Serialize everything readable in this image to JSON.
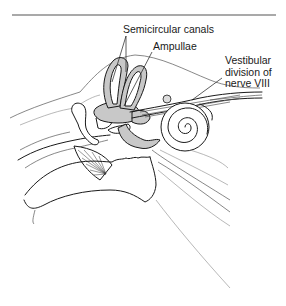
{
  "figure": {
    "labels": {
      "semicircular_canals": "Semicircular canals",
      "ampullae": "Ampullae",
      "vestibular_nerve_line1": "Vestibular",
      "vestibular_nerve_line2": "division of",
      "vestibular_nerve_line3": "nerve VIII"
    },
    "colors": {
      "line": "#1a1a1a",
      "fill_gray": "#c8c8c8",
      "background": "#ffffff"
    }
  }
}
